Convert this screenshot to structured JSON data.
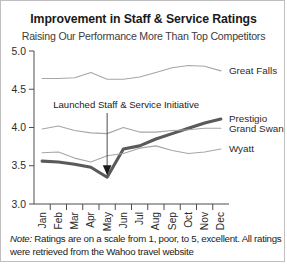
{
  "chart_data": {
    "type": "line",
    "title": "Improvement in Staff & Service Ratings",
    "subtitle": "Raising Our Performance More Than Top Competitors",
    "xlabel": "",
    "ylabel": "",
    "ylim": [
      3.0,
      5.0
    ],
    "yticks": [
      "3.0",
      "3.5",
      "4.0",
      "4.5",
      "5.0"
    ],
    "grid": false,
    "legend_position": "right-inline",
    "categories": [
      "Jan",
      "Feb",
      "Mar",
      "Apr",
      "May",
      "Jun",
      "Jul",
      "Aug",
      "Sep",
      "Oct",
      "Nov",
      "Dec"
    ],
    "series": [
      {
        "name": "Great Falls",
        "color": "#a6a6a6",
        "emphasis": false,
        "values": [
          4.64,
          4.64,
          4.65,
          4.72,
          4.63,
          4.63,
          4.66,
          4.72,
          4.78,
          4.81,
          4.8,
          4.74
        ]
      },
      {
        "name": "Prestigio",
        "color": "#5a5a5a",
        "emphasis": true,
        "values": [
          3.56,
          3.55,
          3.52,
          3.48,
          3.35,
          3.72,
          3.76,
          3.85,
          3.92,
          3.99,
          4.06,
          4.11
        ]
      },
      {
        "name": "Grand Swan",
        "color": "#a6a6a6",
        "emphasis": false,
        "values": [
          3.98,
          4.02,
          3.96,
          3.93,
          3.92,
          4.0,
          3.94,
          3.94,
          3.96,
          3.97,
          3.99,
          3.99
        ]
      },
      {
        "name": "Wyatt",
        "color": "#a6a6a6",
        "emphasis": false,
        "values": [
          3.67,
          3.68,
          3.6,
          3.55,
          3.63,
          3.66,
          3.73,
          3.76,
          3.7,
          3.66,
          3.68,
          3.72
        ]
      }
    ],
    "annotations": [
      {
        "text": "Launched Staff & Service Initiative",
        "target_category": "May",
        "target_value": 3.35
      }
    ],
    "footnote_note_word": "Note:",
    "footnote_text": " Ratings are on a scale from 1, poor, to 5, excellent. All ratings were retrieved from the Wahoo travel website"
  }
}
